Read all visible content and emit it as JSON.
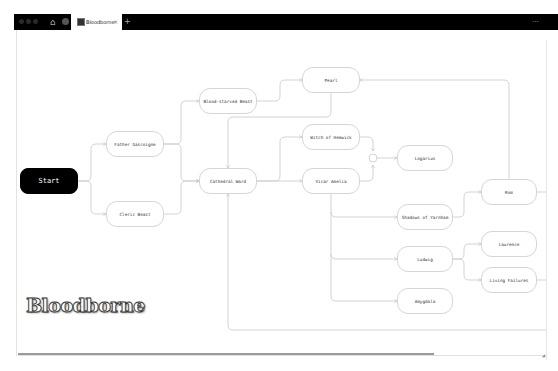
{
  "browser": {
    "tab": {
      "title": "Bloodborne",
      "close_icon": "×"
    },
    "new_tab_label": "+",
    "menu_label": "···",
    "home_icon": "⌂"
  },
  "canvas": {
    "logo_text": "Bloodborne",
    "nodes": {
      "start": "Start",
      "father_gascoigne": "Father Gascoigne",
      "cleric_beast": "Cleric Beast",
      "blood_starved_beast": "Blood-starved Beast",
      "cathedral_ward": "Cathedral Ward",
      "pearl": "Pearl",
      "witch_of_hemwick": "Witch of Hemwick",
      "vicar_amelia": "Vicar Amelia",
      "logarius": "Logarius",
      "shadows_of_yarnham": "Shadows of Yarnham",
      "rom": "Rom",
      "ludwig": "Ludwig",
      "laurence": "Laurence",
      "living_failures": "Living Failures",
      "amygdala": "Amygdala"
    },
    "edges": [
      [
        "Start",
        "Father Gascoigne"
      ],
      [
        "Start",
        "Cleric Beast"
      ],
      [
        "Father Gascoigne",
        "Blood-starved Beast"
      ],
      [
        "Father Gascoigne",
        "Cathedral Ward"
      ],
      [
        "Cleric Beast",
        "Cathedral Ward"
      ],
      [
        "Blood-starved Beast",
        "Pearl"
      ],
      [
        "Blood-starved Beast",
        "Cathedral Ward"
      ],
      [
        "Pearl",
        "Cathedral Ward"
      ],
      [
        "Cathedral Ward",
        "Witch of Hemwick"
      ],
      [
        "Cathedral Ward",
        "Vicar Amelia"
      ],
      [
        "Witch of Hemwick",
        "Logarius"
      ],
      [
        "Vicar Amelia",
        "Logarius"
      ],
      [
        "Vicar Amelia",
        "Shadows of Yarnham"
      ],
      [
        "Vicar Amelia",
        "Ludwig"
      ],
      [
        "Vicar Amelia",
        "Amygdala"
      ],
      [
        "Shadows of Yarnham",
        "Rom"
      ],
      [
        "Rom",
        "Pearl"
      ],
      [
        "Ludwig",
        "Laurence"
      ],
      [
        "Ludwig",
        "Living Failures"
      ],
      [
        "Living Failures",
        "Cathedral Ward"
      ]
    ]
  },
  "colors": {
    "start_fill": "#000000",
    "node_border": "#d6d6d6",
    "edge": "#c4c4c4",
    "chrome": "#000000"
  }
}
